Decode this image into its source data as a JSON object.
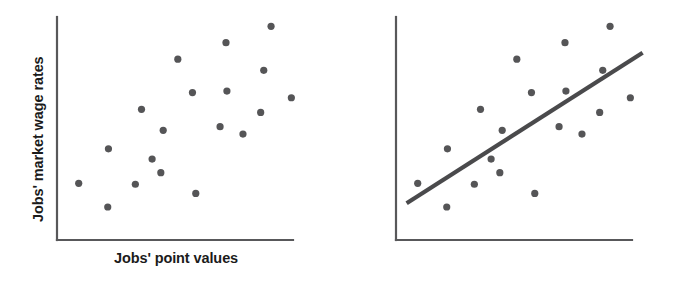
{
  "figure": {
    "background_color": "#ffffff",
    "panel_count": 2
  },
  "labels": {
    "x_axis": "Jobs' point values",
    "y_axis": "Jobs' market wage rates"
  },
  "colors": {
    "point": "#555557",
    "axis": "#58585a",
    "trend_line": "#4a4a4c",
    "text": "#1b1b1b"
  },
  "chart_data": [
    {
      "type": "scatter",
      "title": "",
      "xlabel": "Jobs' point values",
      "ylabel": "Jobs' market wage rates",
      "xlim": [
        0,
        100
      ],
      "ylim": [
        0,
        100
      ],
      "grid": false,
      "legend": "none",
      "axis_ticks": "none",
      "trend_line": null,
      "points": [
        {
          "x": 9.2,
          "y": 25.4
        },
        {
          "x": 21.5,
          "y": 14.8
        },
        {
          "x": 21.8,
          "y": 40.9
        },
        {
          "x": 33.2,
          "y": 25.0
        },
        {
          "x": 35.8,
          "y": 58.6
        },
        {
          "x": 40.3,
          "y": 36.3
        },
        {
          "x": 44.0,
          "y": 30.2
        },
        {
          "x": 45.0,
          "y": 49.2
        },
        {
          "x": 51.2,
          "y": 81.1
        },
        {
          "x": 57.4,
          "y": 66.1
        },
        {
          "x": 58.8,
          "y": 20.9
        },
        {
          "x": 69.1,
          "y": 50.8
        },
        {
          "x": 71.6,
          "y": 88.5
        },
        {
          "x": 72.0,
          "y": 66.8
        },
        {
          "x": 78.8,
          "y": 47.5
        },
        {
          "x": 86.3,
          "y": 57.2
        },
        {
          "x": 87.6,
          "y": 76.1
        },
        {
          "x": 90.7,
          "y": 95.8
        },
        {
          "x": 99.3,
          "y": 63.8
        }
      ]
    },
    {
      "type": "scatter",
      "title": "",
      "xlabel": "Jobs' point values",
      "ylabel": "Jobs' market wage rates",
      "xlim": [
        0,
        100
      ],
      "ylim": [
        0,
        100
      ],
      "grid": false,
      "legend": "none",
      "axis_ticks": "none",
      "trend_line": {
        "label": "line of best fit",
        "x_start": 4.5,
        "y_start": 16.5,
        "x_end": 104.5,
        "y_end": 84.0
      },
      "points": [
        {
          "x": 9.2,
          "y": 25.4
        },
        {
          "x": 21.5,
          "y": 14.8
        },
        {
          "x": 21.8,
          "y": 40.9
        },
        {
          "x": 33.2,
          "y": 25.0
        },
        {
          "x": 35.8,
          "y": 58.6
        },
        {
          "x": 40.3,
          "y": 36.3
        },
        {
          "x": 44.0,
          "y": 30.2
        },
        {
          "x": 45.0,
          "y": 49.2
        },
        {
          "x": 51.2,
          "y": 81.1
        },
        {
          "x": 57.4,
          "y": 66.1
        },
        {
          "x": 58.8,
          "y": 20.9
        },
        {
          "x": 69.1,
          "y": 50.8
        },
        {
          "x": 71.6,
          "y": 88.5
        },
        {
          "x": 72.0,
          "y": 66.8
        },
        {
          "x": 78.8,
          "y": 47.5
        },
        {
          "x": 86.3,
          "y": 57.2
        },
        {
          "x": 87.6,
          "y": 76.1
        },
        {
          "x": 90.7,
          "y": 95.8
        },
        {
          "x": 99.3,
          "y": 63.8
        }
      ]
    }
  ]
}
